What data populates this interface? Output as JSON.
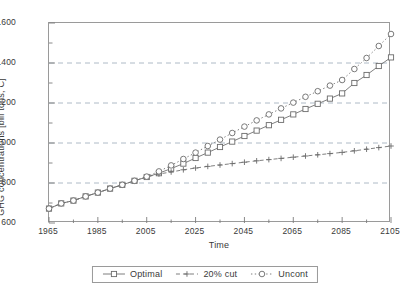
{
  "chart_data": {
    "type": "line",
    "title": "",
    "xlabel": "Time",
    "ylabel": "GHG concentrations [bill tons, C]",
    "xlim": [
      1965,
      2105
    ],
    "ylim": [
      600,
      1600
    ],
    "xticks": [
      1965,
      1985,
      2005,
      2025,
      2045,
      2065,
      2085,
      2105
    ],
    "yticks": [
      600,
      800,
      1000,
      1200,
      1400,
      1600
    ],
    "xtick_labels": [
      "1965",
      "1985",
      "2005",
      "2025",
      "2045",
      "2065",
      "2085",
      "2105"
    ],
    "ytick_labels": [
      "600",
      "800",
      "1000",
      "1200",
      "1400",
      "1600"
    ],
    "x_minor_step": 10,
    "grid": "horizontal-dashed",
    "legend_position": "bottom-center",
    "x": [
      1965,
      1970,
      1975,
      1980,
      1985,
      1990,
      1995,
      2000,
      2005,
      2010,
      2015,
      2020,
      2025,
      2030,
      2035,
      2040,
      2045,
      2050,
      2055,
      2060,
      2065,
      2070,
      2075,
      2080,
      2085,
      2090,
      2095,
      2100,
      2105
    ],
    "series": [
      {
        "name": "Optimal",
        "marker": "open-square",
        "line": "solid",
        "values": [
          672,
          698,
          712,
          733,
          752,
          772,
          791,
          811,
          830,
          849,
          872,
          897,
          925,
          952,
          980,
          1007,
          1035,
          1062,
          1089,
          1116,
          1143,
          1170,
          1196,
          1222,
          1248,
          1300,
          1340,
          1385,
          1428
        ]
      },
      {
        "name": "20% cut",
        "marker": "plus",
        "line": "dashed",
        "values": [
          672,
          698,
          712,
          733,
          752,
          772,
          791,
          811,
          830,
          845,
          855,
          866,
          875,
          883,
          890,
          897,
          904,
          911,
          917,
          923,
          929,
          935,
          941,
          947,
          953,
          961,
          969,
          977,
          985
        ]
      },
      {
        "name": "Uncont",
        "marker": "open-circle",
        "line": "dotted",
        "values": [
          672,
          698,
          712,
          733,
          752,
          772,
          791,
          811,
          832,
          858,
          888,
          920,
          952,
          985,
          1017,
          1050,
          1082,
          1113,
          1143,
          1173,
          1202,
          1231,
          1259,
          1287,
          1315,
          1370,
          1425,
          1485,
          1545
        ]
      }
    ]
  },
  "legend": {
    "items": [
      {
        "label": "Optimal"
      },
      {
        "label": "20% cut"
      },
      {
        "label": "Uncont"
      }
    ]
  }
}
